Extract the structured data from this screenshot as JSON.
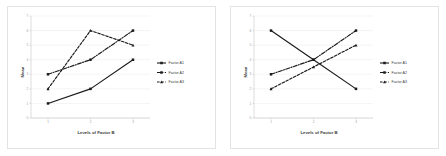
{
  "figure": {
    "panel_count": 2,
    "background_color": "#ffffff",
    "border_color": "#e3e3e3",
    "line_color": "#1a1a1a",
    "grid_color": "#e8e8e8"
  },
  "panels": [
    {
      "name": "left-panel",
      "chart_data": {
        "type": "line",
        "title": "",
        "xlabel": "Levels of Factor B",
        "ylabel": "Mean",
        "categories": [
          "1",
          "2",
          "3"
        ],
        "x": [
          1,
          2,
          3
        ],
        "xlim": [
          0.6,
          3.4
        ],
        "ylim": [
          0,
          7
        ],
        "yticks": [
          0,
          1,
          2,
          3,
          4,
          5,
          6,
          7
        ],
        "ytick_labels": [
          "0",
          "1",
          "2",
          "3",
          "4",
          "5",
          "6",
          "7"
        ],
        "xtick_labels": [
          "1",
          "2",
          "3"
        ],
        "grid": true,
        "legend_position": "right",
        "series": [
          {
            "name": "Factor A1",
            "style": "solid",
            "marker": "circle",
            "values": [
              1.0,
              2.0,
              4.0
            ]
          },
          {
            "name": "Factor A2",
            "style": "dash-dot",
            "marker": "circle",
            "values": [
              3.0,
              4.0,
              6.0
            ]
          },
          {
            "name": "Factor A3",
            "style": "dashed",
            "marker": "triangle",
            "values": [
              2.0,
              6.0,
              5.0
            ]
          }
        ]
      }
    },
    {
      "name": "right-panel",
      "chart_data": {
        "type": "line",
        "title": "",
        "xlabel": "Levels of Factor B",
        "ylabel": "Mean",
        "categories": [
          "1",
          "2",
          "3"
        ],
        "x": [
          1,
          2,
          3
        ],
        "xlim": [
          0.6,
          3.4
        ],
        "ylim": [
          0,
          7
        ],
        "yticks": [
          0,
          1,
          2,
          3,
          4,
          5,
          6,
          7
        ],
        "ytick_labels": [
          "0",
          "1",
          "2",
          "3",
          "4",
          "5",
          "6",
          "7"
        ],
        "xtick_labels": [
          "1",
          "2",
          "3"
        ],
        "grid": true,
        "legend_position": "right",
        "series": [
          {
            "name": "Factor A1",
            "style": "solid",
            "marker": "circle",
            "values": [
              6.0,
              4.0,
              2.0
            ]
          },
          {
            "name": "Factor A2",
            "style": "dash-dot",
            "marker": "circle",
            "values": [
              3.0,
              4.0,
              6.0
            ]
          },
          {
            "name": "Factor A3",
            "style": "dashed",
            "marker": "triangle",
            "values": [
              2.0,
              3.5,
              5.0
            ]
          }
        ]
      }
    }
  ]
}
